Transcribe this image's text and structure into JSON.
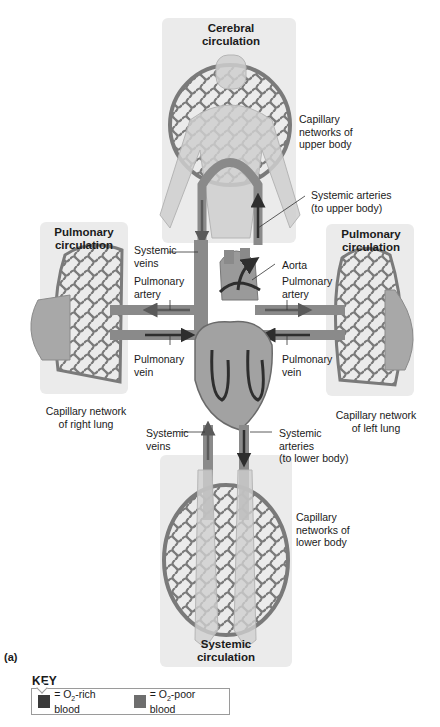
{
  "panels": {
    "cerebral": {
      "title": "Cerebral\ncirculation"
    },
    "pulmonary_left": {
      "title": "Pulmonary\ncirculation"
    },
    "pulmonary_right": {
      "title": "Pulmonary\ncirculation"
    },
    "systemic": {
      "title": "Systemic\ncirculation"
    }
  },
  "labels": {
    "capillary_upper": "Capillary\nnetworks of\nupper body",
    "systemic_arteries_upper": "Systemic arteries\n(to upper body)",
    "systemic_veins_top": "Systemic\nveins",
    "aorta": "Aorta",
    "pulmonary_artery_left": "Pulmonary\nartery",
    "pulmonary_artery_right": "Pulmonary\nartery",
    "pulmonary_vein_left": "Pulmonary\nvein",
    "pulmonary_vein_right": "Pulmonary\nvein",
    "capillary_right_lung": "Capillary network\nof right lung",
    "capillary_left_lung": "Capillary network\nof left lung",
    "systemic_veins_bottom": "Systemic\nveins",
    "systemic_arteries_lower": "Systemic\narteries\n(to lower body)",
    "capillary_lower": "Capillary\nnetworks of\nlower body"
  },
  "figure_label": "(a)",
  "key": {
    "title": "KEY",
    "items": [
      {
        "label_prefix": "= O",
        "sub": "2",
        "label_suffix": "-rich blood",
        "color": "#3a3a3a"
      },
      {
        "label_prefix": "= O",
        "sub": "2",
        "label_suffix": "-poor blood",
        "color": "#6e6e6e"
      }
    ]
  },
  "colors": {
    "panel_bg": "#ebebeb",
    "vessel": "#8a8a8a",
    "vessel_dark": "#6a6a6a",
    "body_fill": "#d2d2d2",
    "rich_blood": "#3a3a3a",
    "poor_blood": "#6e6e6e"
  }
}
